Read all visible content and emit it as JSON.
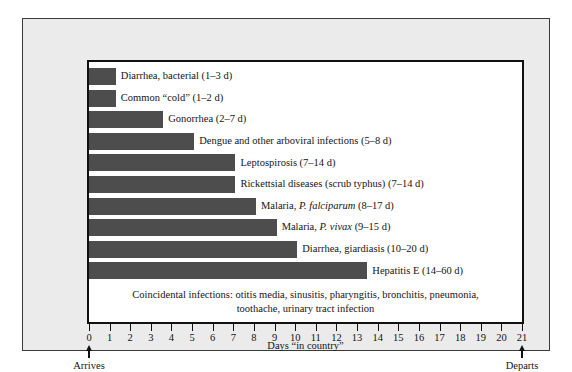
{
  "chart_data": {
    "type": "bar",
    "title": "",
    "orientation": "horizontal",
    "xlabel": "Days \"in country\"",
    "ylabel": "",
    "xlim": [
      0,
      21
    ],
    "grid": false,
    "legend": null,
    "bar_color": "#4d4d4d",
    "xticks": [
      0,
      1,
      2,
      3,
      4,
      5,
      6,
      7,
      8,
      9,
      10,
      11,
      12,
      13,
      14,
      15,
      16,
      17,
      18,
      19,
      20,
      21
    ],
    "xticklabels": [
      "0",
      "1",
      "2",
      "3",
      "4",
      "5",
      "6",
      "7",
      "8",
      "9",
      "10",
      "11",
      "12",
      "13",
      "14",
      "15",
      "16",
      "17",
      "18",
      "19",
      "20",
      "21"
    ],
    "categories": [
      "Diarrhea, bacterial",
      "Common “cold”",
      "Gonorrhea",
      "Dengue and other arboviral infections",
      "Leptospirosis",
      "Rickettsial diseases (scrub typhus)",
      "Malaria, P. falciparum",
      "Malaria, P. vivax",
      "Diarrhea, giardiasis",
      "Hepatitis E"
    ],
    "values": [
      1.3,
      1.3,
      3.6,
      5.1,
      7.1,
      7.1,
      8.1,
      9.1,
      10.1,
      13.5
    ],
    "incubation_ranges": [
      "1–3 d",
      "1–2 d",
      "2–7 d",
      "5–8 d",
      "7–14 d",
      "7–14 d",
      "8–17 d",
      "9–15 d",
      "10–20 d",
      "14–60 d"
    ],
    "annotations": [
      "Coincidental infections: otitis media, sinusitis, pharyngitis, bronchitis, pneumonia, toothache, urinary tract infection"
    ]
  },
  "chart": {
    "bars": [
      {
        "label_plain": "Diarrhea, bacterial",
        "italic_part": "",
        "label_tail": "Diarrhea, bacterial (1–3 d)",
        "value": 1.3
      },
      {
        "label_plain": "Common “cold”",
        "italic_part": "",
        "label_tail": "Common “cold” (1–2 d)",
        "value": 1.3
      },
      {
        "label_plain": "Gonorrhea",
        "italic_part": "",
        "label_tail": "Gonorrhea (2–7 d)",
        "value": 3.6
      },
      {
        "label_plain": "Dengue and other arboviral infections",
        "italic_part": "",
        "label_tail": "Dengue and other arboviral infections (5–8 d)",
        "value": 5.1
      },
      {
        "label_plain": "Leptospirosis",
        "italic_part": "",
        "label_tail": "Leptospirosis (7–14 d)",
        "value": 7.1
      },
      {
        "label_plain": "Rickettsial diseases (scrub typhus)",
        "italic_part": "",
        "label_tail": "Rickettsial diseases (scrub typhus) (7–14 d)",
        "value": 7.1
      },
      {
        "label_pre": "Malaria, ",
        "italic_part": "P. falciparum",
        "label_post": " (8–17 d)",
        "value": 8.1
      },
      {
        "label_pre": "Malaria, ",
        "italic_part": "P. vivax",
        "label_post": " (9–15 d)",
        "value": 9.1
      },
      {
        "label_plain": "Diarrhea, giardiasis",
        "italic_part": "",
        "label_tail": "Diarrhea, giardiasis (10–20 d)",
        "value": 10.1
      },
      {
        "label_plain": "Hepatitis E",
        "italic_part": "",
        "label_tail": "Hepatitis E (14–60 d)",
        "value": 13.5
      }
    ],
    "coincidental_line1": "Coincidental infections: otitis media, sinusitis, pharyngitis, bronchitis, pneumonia,",
    "coincidental_line2": "toothache, urinary tract infection",
    "axis_title": "Days “in country”",
    "arrives_label": "Arrives",
    "departs_label": "Departs"
  }
}
